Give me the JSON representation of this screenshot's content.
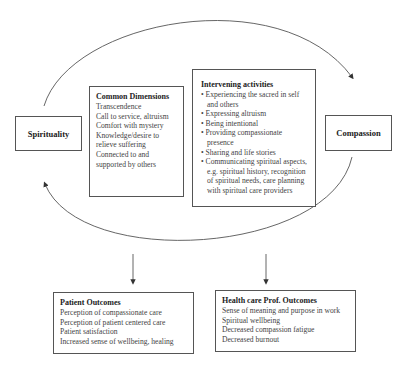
{
  "nodes": {
    "spirituality": {
      "label": "Spirituality"
    },
    "compassion": {
      "label": "Compassion"
    },
    "common_dimensions": {
      "title": "Common Dimensions",
      "items": [
        "Transcendence",
        "Call to service, altruism",
        "Comfort with mystery",
        "Knowledge/desire to relieve suffering",
        "Connected to and supported by others"
      ]
    },
    "intervening_activities": {
      "title": "Intervening activities",
      "items": [
        "Experiencing the sacred in self and others",
        "Expressing altruism",
        "Being intentional",
        "Providing compassionate presence",
        "Sharing and life stories",
        "Communicating spiritual aspects, e.g. spiritual history, recognition of spiritual needs, care planning with spiritual care providers"
      ]
    },
    "patient_outcomes": {
      "title": "Patient Outcomes",
      "items": [
        "Perception of compassionate care",
        "Perception of patient centered care",
        "Patient satisfaction",
        "Increased sense of wellbeing, healing"
      ]
    },
    "hcp_outcomes": {
      "title": "Health care Prof. Outcomes",
      "items": [
        "Sense of meaning and purpose in work",
        "Spiritual wellbeing",
        "Decreased compassion fatigue",
        "Decreased burnout"
      ]
    }
  },
  "edges": [
    {
      "from": "Spirituality",
      "to": "Compassion",
      "style": "curved-top"
    },
    {
      "from": "Compassion",
      "to": "Spirituality",
      "style": "curved-bottom"
    },
    {
      "from": "cycle",
      "to": "Patient Outcomes",
      "style": "straight-down"
    },
    {
      "from": "cycle",
      "to": "Health care Prof. Outcomes",
      "style": "straight-down"
    }
  ],
  "colors": {
    "line": "#555555",
    "text": "#333333",
    "background": "#ffffff"
  }
}
